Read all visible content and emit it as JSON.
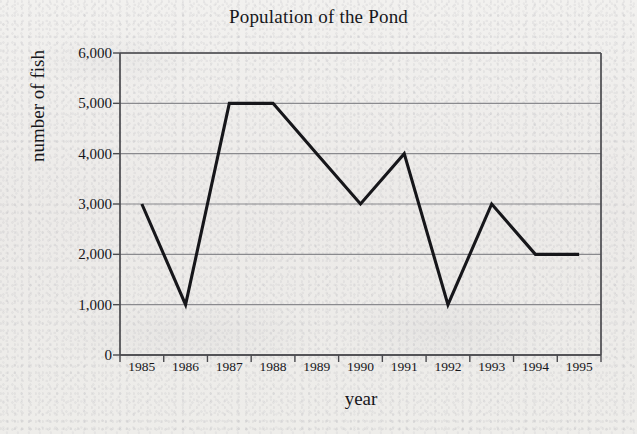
{
  "chart_data": {
    "type": "line",
    "title": "Population of the Pond",
    "xlabel": "year",
    "ylabel": "number of fish",
    "categories": [
      "1985",
      "1986",
      "1987",
      "1988",
      "1989",
      "1990",
      "1991",
      "1992",
      "1993",
      "1994",
      "1995"
    ],
    "values": [
      3000,
      1000,
      5000,
      5000,
      4000,
      3000,
      4000,
      1000,
      3000,
      2000,
      2000
    ],
    "series": [
      {
        "name": "number of fish",
        "values": [
          3000,
          1000,
          5000,
          5000,
          4000,
          3000,
          4000,
          1000,
          3000,
          2000,
          2000
        ]
      }
    ],
    "ylim": [
      0,
      6000
    ],
    "ytick_labels": [
      "0",
      "1,000",
      "2,000",
      "3,000",
      "4,000",
      "5,000",
      "6,000"
    ],
    "ytick_values": [
      0,
      1000,
      2000,
      3000,
      4000,
      5000,
      6000
    ],
    "grid": "horizontal",
    "legend": "none",
    "markers": "none",
    "line_color": "#16161a",
    "grid_color": "#8a8a8e",
    "axis_color": "#4a4a4e",
    "background_color": "#eeedeb"
  }
}
